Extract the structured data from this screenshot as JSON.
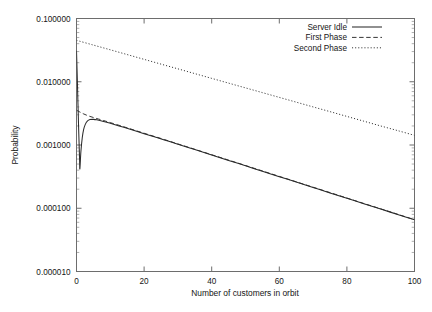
{
  "chart_data": {
    "type": "line",
    "title": "",
    "xlabel": "Number of customers in orbit",
    "ylabel": "Probability",
    "yscale": "log",
    "xscale": "linear",
    "xlim": [
      0,
      100
    ],
    "ylim": [
      1e-05,
      0.1
    ],
    "grid": false,
    "legend_position": "top-right",
    "xticks": [
      0,
      20,
      40,
      60,
      80,
      100
    ],
    "xtick_labels": [
      "0",
      "20",
      "40",
      "60",
      "80",
      "100"
    ],
    "yticks": [
      0.1,
      0.01,
      0.001,
      0.0001,
      1e-05
    ],
    "ytick_labels": [
      "0.100000",
      "0.010000",
      "0.001000",
      "0.000100",
      "0.000010"
    ],
    "series": [
      {
        "name": "Server Idle",
        "style": "solid",
        "color": "#2b2b2b",
        "x": [
          0,
          0.3,
          0.6,
          0.9,
          1.0,
          1.3,
          1.7,
          2.1,
          2.6,
          3.2,
          4.0,
          5.0,
          6.0,
          8.0,
          10.0,
          14.0,
          18.0,
          22.0,
          26.0,
          30.0,
          35.0,
          40.0,
          45.0,
          50.0,
          55.0,
          60.0,
          65.0,
          70.0,
          75.0,
          80.0,
          85.0,
          90.0,
          95.0,
          100.0
        ],
        "y": [
          0.031,
          0.0085,
          0.0021,
          0.00062,
          0.00042,
          0.00078,
          0.0013,
          0.00175,
          0.00212,
          0.00238,
          0.00252,
          0.00254,
          0.0025,
          0.00236,
          0.0022,
          0.0019,
          0.00163,
          0.0014,
          0.0012,
          0.00103,
          0.000846,
          0.000695,
          0.000571,
          0.000469,
          0.000385,
          0.000316,
          0.00026,
          0.000213,
          0.000175,
          0.000144,
          0.000118,
          9.71e-05,
          7.98e-05,
          6.55e-05
        ]
      },
      {
        "name": "First Phase",
        "style": "dashed",
        "color": "#2b2b2b",
        "x": [
          0,
          1,
          2,
          3,
          4,
          5,
          6,
          8,
          10,
          14,
          18,
          22,
          26,
          30,
          35,
          40,
          45,
          50,
          55,
          60,
          65,
          70,
          75,
          80,
          85,
          90,
          95,
          100
        ],
        "y": [
          0.00355,
          0.00332,
          0.00312,
          0.00296,
          0.00283,
          0.00272,
          0.00262,
          0.00244,
          0.00226,
          0.00194,
          0.00166,
          0.00142,
          0.00122,
          0.00104,
          0.000855,
          0.000702,
          0.000577,
          0.000474,
          0.000389,
          0.000319,
          0.000262,
          0.000215,
          0.000177,
          0.000145,
          0.000119,
          9.79e-05,
          8.04e-05,
          6.6e-05
        ]
      },
      {
        "name": "Second Phase",
        "style": "dotted",
        "color": "#2b2b2b",
        "x": [
          0,
          5,
          10,
          15,
          20,
          25,
          30,
          35,
          40,
          45,
          50,
          55,
          60,
          65,
          70,
          75,
          80,
          85,
          90,
          95,
          100
        ],
        "y": [
          0.0452,
          0.038,
          0.032,
          0.0269,
          0.0226,
          0.019,
          0.016,
          0.01345,
          0.01131,
          0.00951,
          0.008,
          0.00673,
          0.00566,
          0.00476,
          0.004,
          0.00337,
          0.00283,
          0.00238,
          0.002,
          0.00169,
          0.00142
        ]
      }
    ]
  },
  "legend": {
    "entries": [
      {
        "label": "Server Idle",
        "style": "solid"
      },
      {
        "label": "First Phase",
        "style": "dashed"
      },
      {
        "label": "Second Phase",
        "style": "dotted"
      }
    ]
  }
}
